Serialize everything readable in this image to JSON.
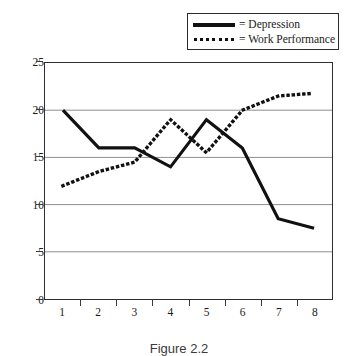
{
  "caption": "Figure 2.2",
  "legend": {
    "position": "top-right",
    "entries": [
      {
        "label": "= Depression",
        "style": "solid",
        "icon": "solid-line-swatch"
      },
      {
        "label": "= Work Performance",
        "style": "dotted",
        "icon": "dotted-line-swatch"
      }
    ]
  },
  "axes": {
    "y_ticks": [
      "0",
      "5",
      "10",
      "15",
      "20",
      "25"
    ],
    "x_ticks": [
      "1",
      "2",
      "3",
      "4",
      "5",
      "6",
      "7",
      "8"
    ]
  },
  "chart_data": {
    "type": "line",
    "title": "Figure 2.2",
    "xlabel": "",
    "ylabel": "",
    "x": [
      1,
      2,
      3,
      4,
      5,
      6,
      7,
      8
    ],
    "categories": [
      "1",
      "2",
      "3",
      "4",
      "5",
      "6",
      "7",
      "8"
    ],
    "series": [
      {
        "name": "Depression",
        "style": "solid",
        "color": "#111111",
        "values": [
          20,
          16,
          16,
          14,
          19,
          16,
          8.5,
          7.5
        ]
      },
      {
        "name": "Work Performance",
        "style": "dotted",
        "color": "#111111",
        "values": [
          12,
          13.5,
          14.5,
          19,
          15.5,
          20,
          21.5,
          21.8
        ]
      }
    ],
    "ylim": [
      0,
      25
    ],
    "ytick_interval": 5,
    "xlim": [
      1,
      8
    ],
    "grid": "horizontal",
    "legend_position": "top-right"
  }
}
